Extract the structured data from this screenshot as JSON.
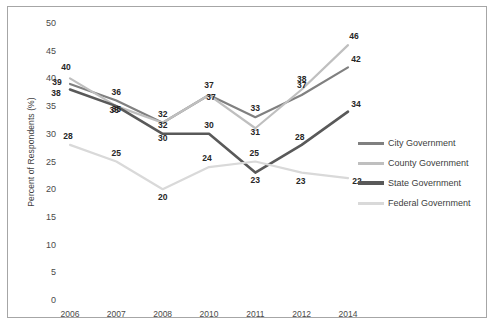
{
  "chart_data": {
    "type": "line",
    "title": "",
    "xlabel": "",
    "ylabel": "Percent of Respondents (%)",
    "categories": [
      "2006",
      "2007",
      "2008",
      "2010",
      "2011",
      "2012",
      "2014"
    ],
    "ylim": [
      0,
      50
    ],
    "ytick_labels": [
      "0",
      "5",
      "10",
      "15",
      "20",
      "25",
      "30",
      "35",
      "40",
      "45",
      "50"
    ],
    "ytick_values": [
      0,
      5,
      10,
      15,
      20,
      25,
      30,
      35,
      40,
      45,
      50
    ],
    "grid": false,
    "legend_position": "right",
    "series": [
      {
        "name": "City Government",
        "color": "#808080",
        "width": 2.2,
        "values": [
          39,
          36,
          32,
          37,
          33,
          37,
          42
        ],
        "labels": [
          "39",
          "36",
          "32",
          "37",
          "33",
          "37",
          "42"
        ]
      },
      {
        "name": "County Government",
        "color": "#bfbfbf",
        "width": 2.2,
        "values": [
          40,
          35,
          32,
          37,
          31,
          38,
          46
        ],
        "labels": [
          "40",
          "35",
          "32",
          "37",
          "31",
          "38",
          "46"
        ]
      },
      {
        "name": "State Government",
        "color": "#595959",
        "width": 2.6,
        "values": [
          38,
          35,
          30,
          30,
          23,
          28,
          34
        ],
        "labels": [
          "38",
          "35",
          "30",
          "30",
          "23",
          "28",
          "34"
        ]
      },
      {
        "name": "Federal Government",
        "color": "#d9d9d9",
        "width": 2.2,
        "values": [
          28,
          25,
          20,
          24,
          25,
          23,
          22
        ],
        "labels": [
          "28",
          "25",
          "20",
          "24",
          "25",
          "23",
          "22"
        ]
      }
    ]
  },
  "legend": {
    "items": [
      {
        "label": "City Government"
      },
      {
        "label": "County Government"
      },
      {
        "label": "State Government"
      },
      {
        "label": "Federal Government"
      }
    ]
  }
}
